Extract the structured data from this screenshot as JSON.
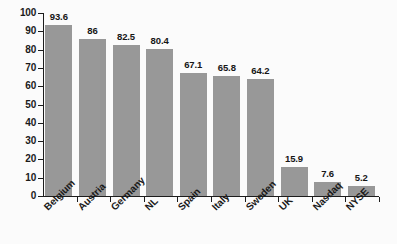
{
  "chart_data": {
    "type": "bar",
    "title": "",
    "subtitle": "",
    "xlabel": "",
    "ylabel": "",
    "ylim": [
      0,
      100
    ],
    "ytick_step": 10,
    "yticks": [
      "100",
      "90",
      "80",
      "70",
      "60",
      "50",
      "40",
      "30",
      "20",
      "10",
      "0"
    ],
    "grid": false,
    "legend": false,
    "categories": [
      "Belgium",
      "Austria",
      "Germany",
      "NL",
      "Spain",
      "Italy",
      "Sweden",
      "UK",
      "Nasdaq",
      "NYSE"
    ],
    "values": [
      93.6,
      86,
      82.5,
      80.4,
      67.1,
      65.8,
      64.2,
      15.9,
      7.6,
      5.2
    ],
    "value_labels": [
      "93.6",
      "86",
      "82.5",
      "80.4",
      "67.1",
      "65.8",
      "64.2",
      "15.9",
      "7.6",
      "5.2"
    ],
    "bar_color": "#989898",
    "axis_color": "#1c1c1c",
    "text_color": "#1a1a1a",
    "background_color": "#fbfbfb"
  }
}
